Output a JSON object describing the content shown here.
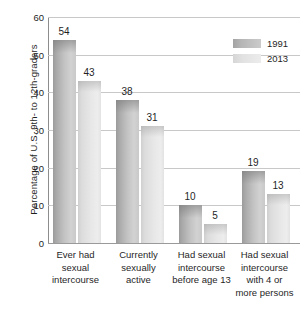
{
  "chart_data": {
    "type": "bar",
    "title": "",
    "xlabel": "",
    "ylabel": "Percentage of U.S. 9th- to 12th-graders",
    "ylim": [
      0,
      60
    ],
    "yticks": [
      0,
      10,
      20,
      30,
      40,
      50,
      60
    ],
    "ytick_labels": [
      "0",
      "10",
      "20",
      "30",
      "40",
      "50",
      "60"
    ],
    "grid": true,
    "legend_position": "top-right",
    "categories": [
      "Ever had sexual intercourse",
      "Currently sexually active",
      "Had sexual intercourse before age 13",
      "Had sexual intercourse with 4 or more persons"
    ],
    "category_lines": [
      [
        "Ever had",
        "sexual",
        "intercourse"
      ],
      [
        "Currently",
        "sexually",
        "active"
      ],
      [
        "Had sexual",
        "intercourse",
        "before age 13"
      ],
      [
        "Had sexual",
        "intercourse",
        "with 4 or",
        "more persons"
      ]
    ],
    "series": [
      {
        "name": "1991",
        "color": "#b5b5b5",
        "values": [
          54,
          38,
          10,
          19
        ]
      },
      {
        "name": "2013",
        "color": "#e3e3e3",
        "values": [
          43,
          31,
          5,
          13
        ]
      }
    ]
  },
  "legend": {
    "items": [
      {
        "label": "1991"
      },
      {
        "label": "2013"
      }
    ]
  }
}
